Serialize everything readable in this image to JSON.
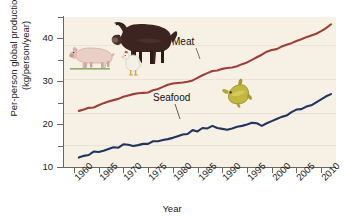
{
  "chart_data": {
    "type": "line",
    "title": "",
    "subtitle": "",
    "xlabel": "Year",
    "ylabel": "Per-person global production (kg/person/year)",
    "ylabel_line1": "Per-person global production",
    "ylabel_line2": "(kg/person/year)",
    "xlim": [
      1958,
      2013
    ],
    "ylim": [
      10,
      45
    ],
    "ytick_labels": [
      "10",
      "20",
      "30",
      "40"
    ],
    "ytick_values": [
      10,
      20,
      30,
      40
    ],
    "yminor_values": [
      15,
      25,
      35,
      45
    ],
    "xtick_labels": [
      "1960",
      "1965",
      "1970",
      "1975",
      "1980",
      "1985",
      "1990",
      "1995",
      "2000",
      "2005",
      "2010"
    ],
    "xtick_values": [
      1960,
      1965,
      1970,
      1975,
      1980,
      1985,
      1990,
      1995,
      2000,
      2005,
      2010
    ],
    "grid": false,
    "legend_position": "inline-annotation",
    "background_color": "#f6f1e4",
    "series": [
      {
        "name": "Meat",
        "color": "#9c4038",
        "label_x": 1981,
        "label_y": 36.5,
        "x": [
          1961,
          1962,
          1963,
          1964,
          1965,
          1966,
          1967,
          1968,
          1969,
          1970,
          1971,
          1972,
          1973,
          1974,
          1975,
          1976,
          1977,
          1978,
          1979,
          1980,
          1981,
          1982,
          1983,
          1984,
          1985,
          1986,
          1987,
          1988,
          1989,
          1990,
          1991,
          1992,
          1993,
          1994,
          1995,
          1996,
          1997,
          1998,
          1999,
          2000,
          2001,
          2002,
          2003,
          2004,
          2005,
          2006,
          2007,
          2008,
          2009,
          2010,
          2011,
          2012
        ],
        "y": [
          23.1,
          23.4,
          23.8,
          23.9,
          24.4,
          24.9,
          25.3,
          25.6,
          25.9,
          26.4,
          26.7,
          27.0,
          27.2,
          27.3,
          27.4,
          27.9,
          28.2,
          28.7,
          29.2,
          29.5,
          29.6,
          29.7,
          29.9,
          30.2,
          30.8,
          31.4,
          31.9,
          32.4,
          32.5,
          32.9,
          33.1,
          33.2,
          33.5,
          34.0,
          34.4,
          35.0,
          35.6,
          36.2,
          36.9,
          37.3,
          37.5,
          38.1,
          38.5,
          38.9,
          39.4,
          39.8,
          40.3,
          40.7,
          41.1,
          41.7,
          42.4,
          43.3
        ]
      },
      {
        "name": "Seafood",
        "color": "#1f3560",
        "label_x": 1976,
        "label_y": 24.5,
        "x": [
          1961,
          1962,
          1963,
          1964,
          1965,
          1966,
          1967,
          1968,
          1969,
          1970,
          1971,
          1972,
          1973,
          1974,
          1975,
          1976,
          1977,
          1978,
          1979,
          1980,
          1981,
          1982,
          1983,
          1984,
          1985,
          1986,
          1987,
          1988,
          1989,
          1990,
          1991,
          1992,
          1993,
          1994,
          1995,
          1996,
          1997,
          1998,
          1999,
          2000,
          2001,
          2002,
          2003,
          2004,
          2005,
          2006,
          2007,
          2008,
          2009,
          2010,
          2011,
          2012
        ],
        "y": [
          12.2,
          12.6,
          12.8,
          13.6,
          13.5,
          13.8,
          14.2,
          14.6,
          14.5,
          15.3,
          15.2,
          14.9,
          15.1,
          15.4,
          15.4,
          16.0,
          16.0,
          16.3,
          16.5,
          16.8,
          17.2,
          17.6,
          17.7,
          18.6,
          18.3,
          19.1,
          19.0,
          19.6,
          19.1,
          18.9,
          18.7,
          19.0,
          19.4,
          19.6,
          19.9,
          20.3,
          20.2,
          19.6,
          20.2,
          20.7,
          21.2,
          21.7,
          22.0,
          22.8,
          23.4,
          23.5,
          24.1,
          24.4,
          25.1,
          25.8,
          26.5,
          27.0
        ]
      }
    ],
    "annotations": [
      {
        "name": "cow-illustration",
        "description": "dark brown cow"
      },
      {
        "name": "pig-illustration",
        "description": "pink pig"
      },
      {
        "name": "chicken-illustration",
        "description": "white chicken"
      },
      {
        "name": "fish-illustration",
        "description": "olive-yellow fish"
      }
    ]
  }
}
